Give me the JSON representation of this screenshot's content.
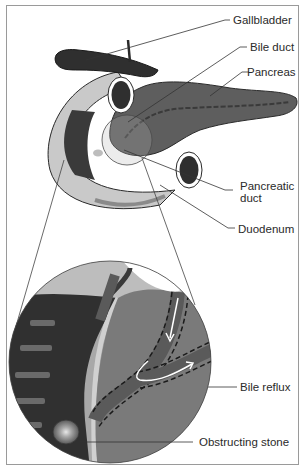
{
  "diagram": {
    "title": "",
    "labels": {
      "gallbladder": "Gallbladder",
      "bile_duct": "Bile duct",
      "pancreas": "Pancreas",
      "pancreatic_duct_line1": "Pancreatic",
      "pancreatic_duct_line2": "duct",
      "duodenum": "Duodenum",
      "bile_reflux": "Bile reflux",
      "obstructing_stone": "Obstructing stone"
    },
    "colors": {
      "organ_dark": "#3a3a3a",
      "pancreas": "#5e5e5e",
      "duodenum_light": "#c9c9c9",
      "line": "#333333",
      "frame": "#9a9a9a"
    }
  }
}
